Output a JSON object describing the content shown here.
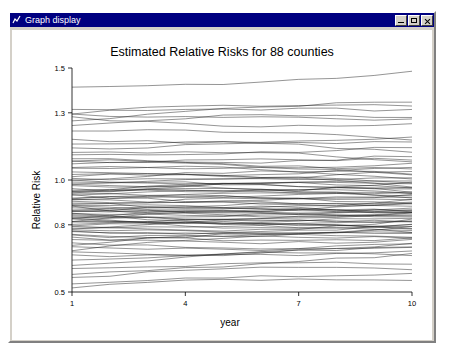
{
  "window": {
    "title": "Graph display",
    "icon": "graph-window-icon",
    "buttons": {
      "minimize": "_",
      "maximize": "□",
      "close": "×"
    }
  },
  "chart_data": {
    "type": "line",
    "title": "Estimated Relative Risks for 88 counties",
    "xlabel": "year",
    "ylabel": "Relative Risk",
    "xlim": [
      1,
      10
    ],
    "ylim": [
      0.5,
      1.5
    ],
    "xticks": [
      1,
      4,
      7,
      10
    ],
    "xtick_labels": [
      "1",
      "4",
      "7",
      "10"
    ],
    "yticks": [
      0.5,
      0.8,
      1.0,
      1.3,
      1.5
    ],
    "ytick_labels": [
      "0.5",
      "0.8",
      "1.0",
      "1.3",
      "1.5"
    ],
    "grid": false,
    "legend": "none",
    "n_series": 88,
    "series_note": "88 county-specific relative risk trajectories, year 1 to 10",
    "series": [
      {
        "name": "county-1",
        "start": 1.42,
        "end": 1.48
      },
      {
        "name": "county-2",
        "start": 1.26,
        "end": 1.35
      },
      {
        "name": "county-3",
        "start": 1.31,
        "end": 1.33
      },
      {
        "name": "county-4",
        "start": 1.3,
        "end": 1.31
      },
      {
        "name": "county-5",
        "start": 1.29,
        "end": 1.27
      },
      {
        "name": "county-6",
        "start": 1.28,
        "end": 1.25
      },
      {
        "name": "county-7",
        "start": 1.24,
        "end": 1.28
      },
      {
        "name": "county-8",
        "start": 1.22,
        "end": 1.18
      },
      {
        "name": "county-9",
        "start": 1.18,
        "end": 1.19
      },
      {
        "name": "county-10",
        "start": 1.16,
        "end": 1.12
      },
      {
        "name": "county-11",
        "start": 1.14,
        "end": 1.17
      },
      {
        "name": "county-12",
        "start": 1.12,
        "end": 1.08
      },
      {
        "name": "county-13",
        "start": 1.11,
        "end": 1.15
      },
      {
        "name": "county-14",
        "start": 1.1,
        "end": 1.05
      },
      {
        "name": "county-15",
        "start": 1.09,
        "end": 1.11
      },
      {
        "name": "county-16",
        "start": 1.08,
        "end": 1.02
      },
      {
        "name": "county-17",
        "start": 1.07,
        "end": 1.09
      },
      {
        "name": "county-18",
        "start": 1.06,
        "end": 1.0
      },
      {
        "name": "county-19",
        "start": 1.05,
        "end": 1.07
      },
      {
        "name": "county-20",
        "start": 1.04,
        "end": 0.99
      },
      {
        "name": "county-21",
        "start": 1.03,
        "end": 1.06
      },
      {
        "name": "county-22",
        "start": 1.02,
        "end": 0.97
      },
      {
        "name": "county-23",
        "start": 1.01,
        "end": 1.04
      },
      {
        "name": "county-24",
        "start": 1.0,
        "end": 0.96
      },
      {
        "name": "county-25",
        "start": 1.0,
        "end": 1.03
      },
      {
        "name": "county-26",
        "start": 0.99,
        "end": 0.95
      },
      {
        "name": "county-27",
        "start": 0.98,
        "end": 1.01
      },
      {
        "name": "county-28",
        "start": 0.98,
        "end": 0.94
      },
      {
        "name": "county-29",
        "start": 0.97,
        "end": 1.0
      },
      {
        "name": "county-30",
        "start": 0.96,
        "end": 0.93
      },
      {
        "name": "county-31",
        "start": 0.96,
        "end": 0.99
      },
      {
        "name": "county-32",
        "start": 0.95,
        "end": 0.92
      },
      {
        "name": "county-33",
        "start": 0.95,
        "end": 0.98
      },
      {
        "name": "county-34",
        "start": 0.94,
        "end": 0.91
      },
      {
        "name": "county-35",
        "start": 0.94,
        "end": 0.97
      },
      {
        "name": "county-36",
        "start": 0.93,
        "end": 0.9
      },
      {
        "name": "county-37",
        "start": 0.93,
        "end": 0.96
      },
      {
        "name": "county-38",
        "start": 0.92,
        "end": 0.89
      },
      {
        "name": "county-39",
        "start": 0.92,
        "end": 0.95
      },
      {
        "name": "county-40",
        "start": 0.91,
        "end": 0.88
      },
      {
        "name": "county-41",
        "start": 0.91,
        "end": 0.94
      },
      {
        "name": "county-42",
        "start": 0.9,
        "end": 0.87
      },
      {
        "name": "county-43",
        "start": 0.9,
        "end": 0.93
      },
      {
        "name": "county-44",
        "start": 0.89,
        "end": 0.86
      },
      {
        "name": "county-45",
        "start": 0.89,
        "end": 0.92
      },
      {
        "name": "county-46",
        "start": 0.88,
        "end": 0.85
      },
      {
        "name": "county-47",
        "start": 0.88,
        "end": 0.91
      },
      {
        "name": "county-48",
        "start": 0.87,
        "end": 0.85
      },
      {
        "name": "county-49",
        "start": 0.87,
        "end": 0.9
      },
      {
        "name": "county-50",
        "start": 0.86,
        "end": 0.84
      },
      {
        "name": "county-51",
        "start": 0.86,
        "end": 0.89
      },
      {
        "name": "county-52",
        "start": 0.86,
        "end": 0.83
      },
      {
        "name": "county-53",
        "start": 0.85,
        "end": 0.88
      },
      {
        "name": "county-54",
        "start": 0.85,
        "end": 0.82
      },
      {
        "name": "county-55",
        "start": 0.84,
        "end": 0.87
      },
      {
        "name": "county-56",
        "start": 0.84,
        "end": 0.81
      },
      {
        "name": "county-57",
        "start": 0.84,
        "end": 0.86
      },
      {
        "name": "county-58",
        "start": 0.83,
        "end": 0.8
      },
      {
        "name": "county-59",
        "start": 0.83,
        "end": 0.86
      },
      {
        "name": "county-60",
        "start": 0.82,
        "end": 0.79
      },
      {
        "name": "county-61",
        "start": 0.82,
        "end": 0.85
      },
      {
        "name": "county-62",
        "start": 0.81,
        "end": 0.78
      },
      {
        "name": "county-63",
        "start": 0.81,
        "end": 0.84
      },
      {
        "name": "county-64",
        "start": 0.8,
        "end": 0.78
      },
      {
        "name": "county-65",
        "start": 0.8,
        "end": 0.83
      },
      {
        "name": "county-66",
        "start": 0.79,
        "end": 0.77
      },
      {
        "name": "county-67",
        "start": 0.79,
        "end": 0.82
      },
      {
        "name": "county-68",
        "start": 0.78,
        "end": 0.76
      },
      {
        "name": "county-69",
        "start": 0.78,
        "end": 0.81
      },
      {
        "name": "county-70",
        "start": 0.77,
        "end": 0.75
      },
      {
        "name": "county-71",
        "start": 0.77,
        "end": 0.8
      },
      {
        "name": "county-72",
        "start": 0.76,
        "end": 0.74
      },
      {
        "name": "county-73",
        "start": 0.75,
        "end": 0.79
      },
      {
        "name": "county-74",
        "start": 0.74,
        "end": 0.73
      },
      {
        "name": "county-75",
        "start": 0.73,
        "end": 0.78
      },
      {
        "name": "county-76",
        "start": 0.72,
        "end": 0.72
      },
      {
        "name": "county-77",
        "start": 0.71,
        "end": 0.76
      },
      {
        "name": "county-78",
        "start": 0.7,
        "end": 0.7
      },
      {
        "name": "county-79",
        "start": 0.69,
        "end": 0.74
      },
      {
        "name": "county-80",
        "start": 0.68,
        "end": 0.68
      },
      {
        "name": "county-81",
        "start": 0.66,
        "end": 0.72
      },
      {
        "name": "county-82",
        "start": 0.64,
        "end": 0.66
      },
      {
        "name": "county-83",
        "start": 0.62,
        "end": 0.7
      },
      {
        "name": "county-84",
        "start": 0.6,
        "end": 0.63
      },
      {
        "name": "county-85",
        "start": 0.58,
        "end": 0.67
      },
      {
        "name": "county-86",
        "start": 0.56,
        "end": 0.6
      },
      {
        "name": "county-87",
        "start": 0.54,
        "end": 0.58
      },
      {
        "name": "county-88",
        "start": 0.52,
        "end": 0.55
      }
    ]
  }
}
